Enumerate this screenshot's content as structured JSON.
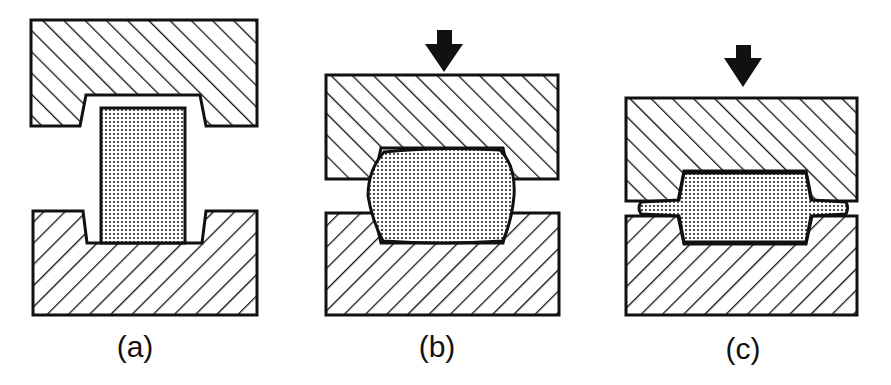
{
  "figure": {
    "panels": [
      {
        "id": "a",
        "label": "(a)",
        "stage": "billet placed between open dies",
        "arrow": false
      },
      {
        "id": "b",
        "label": "(b)",
        "stage": "dies closing, billet deforming",
        "arrow": true
      },
      {
        "id": "c",
        "label": "(c)",
        "stage": "dies closed, flash formed",
        "arrow": true
      }
    ],
    "colors": {
      "ink": "#111111",
      "background": "#ffffff",
      "workpiece_fill": "#cfcfcf"
    }
  }
}
